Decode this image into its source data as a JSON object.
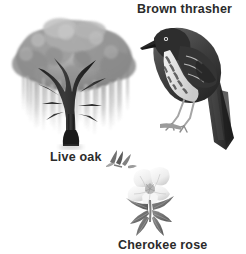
{
  "page": {
    "background_color": "#ffffff",
    "text_color": "#2b2b2b",
    "width": 246,
    "height": 254,
    "style": "grayscale natural-history illustration plate"
  },
  "items": [
    {
      "id": "live-oak",
      "label": "Live oak",
      "icon": "live-oak-tree-illustration",
      "description": "Broad gray live oak tree with hanging Spanish moss and dark branching trunk",
      "label_position": "below-left",
      "colors": {
        "canopy": "#8e8e8e",
        "canopy_light": "#bdbdbd",
        "moss": "#c9c9c9",
        "trunk": "#2e2e2e"
      }
    },
    {
      "id": "brown-thrasher",
      "label": "Brown thrasher",
      "icon": "brown-thrasher-bird-illustration",
      "description": "Perched bird with long dark tail, streaked breast and pale wing bars",
      "label_position": "above-right",
      "colors": {
        "body": "#4a4a4a",
        "body_dark": "#2a2a2a",
        "breast": "#e8e8e8",
        "streaks": "#5a5a5a",
        "perch": "#6a6a6a"
      }
    },
    {
      "id": "cherokee-rose",
      "label": "Cherokee rose",
      "icon": "cherokee-rose-flower-illustration",
      "description": "White rose blossom with yellow-gray center and dark pointed compound leaves, plus a small bud sprig above",
      "label_position": "below-center",
      "colors": {
        "petal": "#fafafa",
        "petal_shade": "#d8d8d8",
        "center": "#a8a8a8",
        "leaf": "#7d7d7d",
        "leaf_dark": "#5c5c5c",
        "stem": "#8a8a8a"
      }
    }
  ]
}
